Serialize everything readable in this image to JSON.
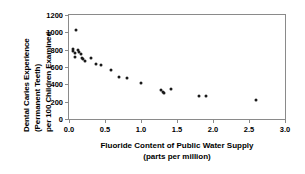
{
  "chart_data": {
    "type": "scatter",
    "title": "",
    "xlabel": "Fluoride Content of Public Water Supply (parts per million)",
    "xlabel_line1": "Fluoride Content of Public Water Supply",
    "xlabel_line2": "(parts per million)",
    "ylabel": "Dental Caries Experience (Permanent Teeth) per 100 Children Examined",
    "ylabel_line1": "Dental Caries Experience",
    "ylabel_line2": "(Permanent Teeth)",
    "ylabel_line3": "per 100 Children Examined",
    "xlim": [
      0.0,
      3.0
    ],
    "ylim": [
      0,
      1200
    ],
    "xticks": [
      "0.0",
      "0.5",
      "1.0",
      "1.5",
      "2.0",
      "2.5",
      "3.0"
    ],
    "xtick_values": [
      0.0,
      0.5,
      1.0,
      1.5,
      2.0,
      2.5,
      3.0
    ],
    "yticks": [
      "0",
      "200",
      "400",
      "600",
      "800",
      "1000",
      "1200"
    ],
    "ytick_values": [
      0,
      200,
      400,
      600,
      800,
      1000,
      1200
    ],
    "grid": false,
    "legend": false,
    "marker": "dot",
    "marker_color": "#1a1a1a",
    "frame_color": "#8a8a8a",
    "x": [
      0.1,
      0.05,
      0.06,
      0.08,
      0.09,
      0.12,
      0.14,
      0.16,
      0.18,
      0.2,
      0.22,
      0.3,
      0.38,
      0.45,
      0.58,
      0.7,
      0.8,
      1.0,
      1.28,
      1.3,
      1.32,
      1.42,
      1.8,
      1.9,
      2.6
    ],
    "y": [
      1030,
      810,
      790,
      760,
      720,
      800,
      770,
      745,
      700,
      690,
      670,
      700,
      640,
      620,
      560,
      480,
      470,
      420,
      330,
      310,
      300,
      350,
      270,
      265,
      220
    ],
    "points": [
      {
        "x": 0.1,
        "y": 1030
      },
      {
        "x": 0.05,
        "y": 810
      },
      {
        "x": 0.06,
        "y": 790
      },
      {
        "x": 0.08,
        "y": 760
      },
      {
        "x": 0.09,
        "y": 720
      },
      {
        "x": 0.12,
        "y": 800
      },
      {
        "x": 0.14,
        "y": 770
      },
      {
        "x": 0.16,
        "y": 745
      },
      {
        "x": 0.18,
        "y": 700
      },
      {
        "x": 0.2,
        "y": 690
      },
      {
        "x": 0.22,
        "y": 670
      },
      {
        "x": 0.3,
        "y": 700
      },
      {
        "x": 0.38,
        "y": 640
      },
      {
        "x": 0.45,
        "y": 620
      },
      {
        "x": 0.58,
        "y": 560
      },
      {
        "x": 0.7,
        "y": 480
      },
      {
        "x": 0.8,
        "y": 470
      },
      {
        "x": 1.0,
        "y": 420
      },
      {
        "x": 1.28,
        "y": 330
      },
      {
        "x": 1.3,
        "y": 310
      },
      {
        "x": 1.32,
        "y": 300
      },
      {
        "x": 1.42,
        "y": 350
      },
      {
        "x": 1.8,
        "y": 270
      },
      {
        "x": 1.9,
        "y": 265
      },
      {
        "x": 2.6,
        "y": 220
      }
    ]
  }
}
